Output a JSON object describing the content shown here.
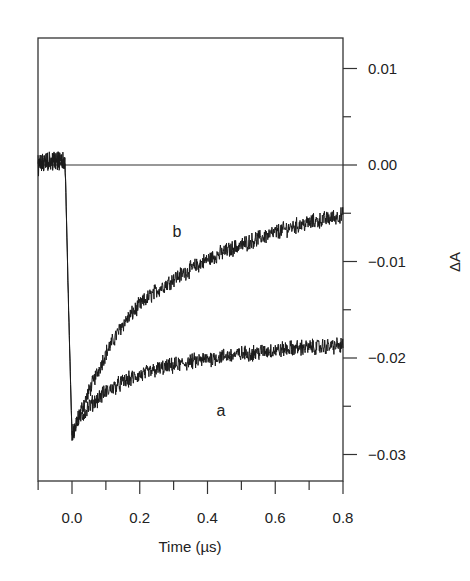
{
  "chart_data": {
    "type": "line",
    "title": "",
    "xlabel": "Time (µs)",
    "ylabel": "ΔA",
    "xlim": [
      -0.1,
      0.8
    ],
    "ylim": [
      -0.0327,
      0.0132
    ],
    "x_ticks": [
      0.0,
      0.2,
      0.4,
      0.6,
      0.8
    ],
    "x_tick_labels": [
      "0.0",
      "0.2",
      "0.4",
      "0.6",
      "0.8"
    ],
    "x_minor_ticks": [
      -0.1,
      0.1,
      0.3,
      0.5,
      0.7
    ],
    "y_ticks": [
      0.01,
      0.0,
      -0.01,
      -0.02,
      -0.03
    ],
    "y_tick_labels": [
      "0.01",
      "0.00",
      "−0.01",
      "−0.02",
      "−0.03"
    ],
    "y_minor_ticks": [
      0.005,
      -0.005,
      -0.015,
      -0.025
    ],
    "y_axis_position": "right",
    "grid": false,
    "legend": "none",
    "reference_line": {
      "y": 0.0
    },
    "annotations": [
      {
        "text": "b",
        "x": 0.31,
        "y": -0.0075
      },
      {
        "text": "a",
        "x": 0.44,
        "y": -0.026
      }
    ],
    "series": [
      {
        "name": "b",
        "x": [
          -0.1,
          -0.05,
          -0.03,
          -0.02,
          -0.01,
          0.0,
          0.02,
          0.05,
          0.1,
          0.15,
          0.2,
          0.25,
          0.3,
          0.35,
          0.4,
          0.45,
          0.5,
          0.55,
          0.6,
          0.65,
          0.7,
          0.75,
          0.8
        ],
        "values": [
          0.0,
          0.0005,
          0.0005,
          0.0,
          -0.015,
          -0.028,
          -0.026,
          -0.0235,
          -0.0195,
          -0.0165,
          -0.0145,
          -0.013,
          -0.0118,
          -0.0108,
          -0.0098,
          -0.009,
          -0.0083,
          -0.0076,
          -0.007,
          -0.0064,
          -0.006,
          -0.0056,
          -0.0052
        ]
      },
      {
        "name": "a",
        "x": [
          -0.1,
          -0.05,
          -0.03,
          -0.02,
          -0.01,
          0.0,
          0.02,
          0.05,
          0.1,
          0.15,
          0.2,
          0.25,
          0.3,
          0.35,
          0.4,
          0.45,
          0.5,
          0.55,
          0.6,
          0.65,
          0.7,
          0.75,
          0.8
        ],
        "values": [
          0.0,
          0.0005,
          0.0005,
          0.0,
          -0.015,
          -0.028,
          -0.0265,
          -0.025,
          -0.0235,
          -0.0225,
          -0.0218,
          -0.0212,
          -0.0208,
          -0.0204,
          -0.0201,
          -0.0198,
          -0.0196,
          -0.0194,
          -0.0192,
          -0.019,
          -0.0189,
          -0.0188,
          -0.0187
        ]
      }
    ]
  }
}
